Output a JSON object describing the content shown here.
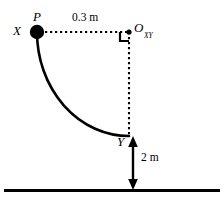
{
  "diagram": {
    "type": "physics-pendulum-diagram",
    "background_color": "#ffffff",
    "stroke_color": "#000000",
    "labels": {
      "bob": "P",
      "start_point": "X",
      "pivot": "O",
      "pivot_subscript": "XY",
      "end_point": "Y"
    },
    "dimensions": {
      "horizontal": "0.3 m",
      "vertical": "2 m"
    },
    "geometry": {
      "pivot": {
        "x": 129,
        "y": 32
      },
      "bob_center": {
        "x": 37,
        "y": 32
      },
      "bob_radius": 7,
      "arc_end": {
        "x": 129,
        "y": 136
      },
      "ground_y": 190,
      "ground_x_start": 4,
      "ground_x_end": 220,
      "arrow_x": 133,
      "arrow_top_y": 138,
      "arrow_bottom_y": 189,
      "right_angle_size": 9
    }
  }
}
